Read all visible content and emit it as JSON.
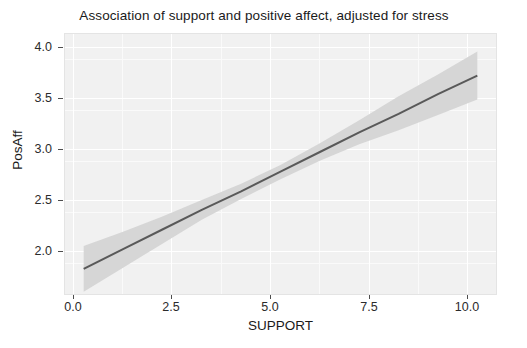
{
  "chart_data": {
    "type": "line",
    "title": "Association of support and positive affect, adjusted for stress",
    "xlabel": "SUPPORT",
    "ylabel": "PosAff",
    "xlim": [
      -0.5,
      10.5
    ],
    "ylim": [
      1.72,
      4.12
    ],
    "xticks": [
      "0.0",
      "2.5",
      "5.0",
      "7.5",
      "10.0"
    ],
    "xtick_values": [
      0.0,
      2.5,
      5.0,
      7.5,
      10.0
    ],
    "yticks": [
      "2.0",
      "2.5",
      "3.0",
      "3.5",
      "4.0"
    ],
    "ytick_values": [
      2.0,
      2.5,
      3.0,
      3.5,
      4.0
    ],
    "grid": true,
    "legend": "none",
    "series": [
      {
        "name": "fitted regression line",
        "color": "#595959",
        "x": [
          0.0,
          1.0,
          2.0,
          3.0,
          4.0,
          5.0,
          6.0,
          7.0,
          8.0,
          9.0,
          10.0
        ],
        "values": [
          1.96,
          2.14,
          2.32,
          2.5,
          2.67,
          2.85,
          3.03,
          3.21,
          3.38,
          3.56,
          3.73
        ]
      },
      {
        "name": "95% confidence band upper",
        "color": "#d4d4d4",
        "x": [
          0.0,
          1.0,
          2.0,
          3.0,
          4.0,
          5.0,
          6.0,
          7.0,
          8.0,
          9.0,
          10.0
        ],
        "values": [
          2.17,
          2.3,
          2.44,
          2.59,
          2.74,
          2.91,
          3.11,
          3.32,
          3.54,
          3.74,
          3.95
        ]
      },
      {
        "name": "95% confidence band lower",
        "color": "#d4d4d4",
        "x": [
          0.0,
          1.0,
          2.0,
          3.0,
          4.0,
          5.0,
          6.0,
          7.0,
          8.0,
          9.0,
          10.0
        ],
        "values": [
          1.75,
          1.97,
          2.19,
          2.41,
          2.6,
          2.78,
          2.95,
          3.1,
          3.23,
          3.37,
          3.51
        ]
      }
    ],
    "annotations": []
  },
  "chart": {
    "title": "Association of support and positive affect, adjusted for stress",
    "x_axis_title": "SUPPORT",
    "y_axis_title": "PosAff",
    "x_tick_labels": [
      "0.0",
      "2.5",
      "5.0",
      "7.5",
      "10.0"
    ],
    "y_tick_labels": [
      "2.0",
      "2.5",
      "3.0",
      "3.5",
      "4.0"
    ],
    "caption_partial": ""
  },
  "colors": {
    "panel_background": "#f1f1f1",
    "grid_major": "#ffffff",
    "grid_minor": "#fafafa",
    "line": "#595959",
    "ribbon": "#d4d4d4",
    "text": "#1a1a1a",
    "page_background": "#ffffff"
  }
}
